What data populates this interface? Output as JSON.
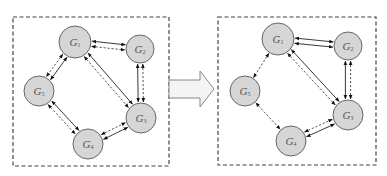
{
  "diagram": {
    "transition_icon": "right-arrow-icon",
    "panels": [
      {
        "id": "before",
        "nodes": [
          {
            "id": "G1",
            "label": "G",
            "sub": "1",
            "x": 75,
            "y": 42,
            "r": 16
          },
          {
            "id": "G2",
            "label": "G",
            "sub": "2",
            "x": 140,
            "y": 49,
            "r": 14
          },
          {
            "id": "G3",
            "label": "G",
            "sub": "3",
            "x": 141,
            "y": 118,
            "r": 15
          },
          {
            "id": "G4",
            "label": "G",
            "sub": "4",
            "x": 88,
            "y": 144,
            "r": 15
          },
          {
            "id": "G5",
            "label": "G",
            "sub": "5",
            "x": 39,
            "y": 91,
            "r": 15
          }
        ],
        "edges": [
          {
            "from": "G1",
            "to": "G2",
            "styles": [
              "solid",
              "dashed"
            ]
          },
          {
            "from": "G1",
            "to": "G5",
            "styles": [
              "solid",
              "dashed"
            ]
          },
          {
            "from": "G1",
            "to": "G3",
            "styles": [
              "solid",
              "dashed"
            ]
          },
          {
            "from": "G2",
            "to": "G3",
            "styles": [
              "dashed",
              "solid"
            ]
          },
          {
            "from": "G5",
            "to": "G4",
            "styles": [
              "solid",
              "dashed"
            ]
          },
          {
            "from": "G4",
            "to": "G3",
            "styles": [
              "dashed",
              "solid"
            ]
          }
        ]
      },
      {
        "id": "after",
        "nodes": [
          {
            "id": "G1",
            "label": "G",
            "sub": "1",
            "x": 278,
            "y": 39,
            "r": 16
          },
          {
            "id": "G2",
            "label": "G",
            "sub": "2",
            "x": 348,
            "y": 46,
            "r": 14
          },
          {
            "id": "G3",
            "label": "G",
            "sub": "3",
            "x": 348,
            "y": 115,
            "r": 15
          },
          {
            "id": "G4",
            "label": "G",
            "sub": "4",
            "x": 291,
            "y": 141,
            "r": 15
          },
          {
            "id": "G5",
            "label": "G",
            "sub": "5",
            "x": 245,
            "y": 91,
            "r": 15
          }
        ],
        "edges": [
          {
            "from": "G1",
            "to": "G2",
            "styles": [
              "solid",
              "solid"
            ]
          },
          {
            "from": "G1",
            "to": "G5",
            "styles": [
              "dashed"
            ]
          },
          {
            "from": "G1",
            "to": "G3",
            "styles": [
              "solid",
              "dashed"
            ]
          },
          {
            "from": "G2",
            "to": "G3",
            "styles": [
              "dashed",
              "solid"
            ]
          },
          {
            "from": "G5",
            "to": "G4",
            "styles": [
              "dashed"
            ]
          },
          {
            "from": "G4",
            "to": "G3",
            "styles": [
              "dashed",
              "solid"
            ]
          }
        ]
      }
    ]
  }
}
